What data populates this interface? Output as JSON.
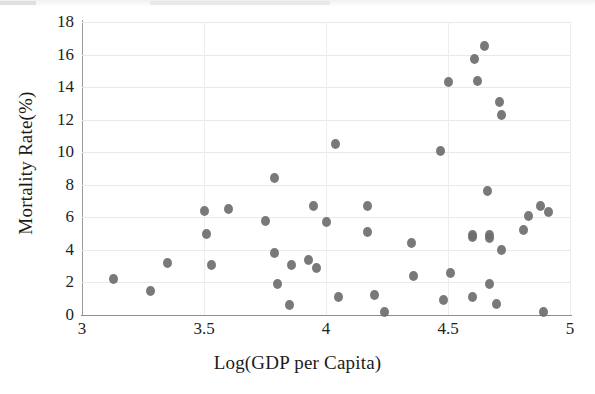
{
  "chart_data": {
    "type": "scatter",
    "title": "",
    "xlabel": "Log(GDP per Capita)",
    "ylabel": "Mortality Rate(%)",
    "xlim": [
      3,
      5
    ],
    "ylim": [
      0,
      18
    ],
    "xticks": [
      "3",
      "3.5",
      "4",
      "4.5",
      "5"
    ],
    "xtick_values": [
      3,
      3.5,
      4,
      4.5,
      5
    ],
    "yticks": [
      "0",
      "2",
      "4",
      "6",
      "8",
      "10",
      "12",
      "14",
      "16",
      "18"
    ],
    "ytick_values": [
      0,
      2,
      4,
      6,
      8,
      10,
      12,
      14,
      16,
      18
    ],
    "grid": "horizontal-and-vertical",
    "legend": "none",
    "marker_color": "#6e6e6e",
    "marker_shape": "circle",
    "series": [
      {
        "name": "countries",
        "points": [
          [
            3.13,
            2.2
          ],
          [
            3.28,
            1.5
          ],
          [
            3.35,
            3.2
          ],
          [
            3.5,
            6.4
          ],
          [
            3.51,
            5.0
          ],
          [
            3.53,
            3.1
          ],
          [
            3.6,
            6.5
          ],
          [
            3.75,
            5.8
          ],
          [
            3.79,
            8.4
          ],
          [
            3.79,
            3.8
          ],
          [
            3.8,
            1.9
          ],
          [
            3.85,
            0.6
          ],
          [
            3.86,
            3.1
          ],
          [
            3.93,
            3.4
          ],
          [
            3.95,
            6.7
          ],
          [
            3.96,
            2.9
          ],
          [
            4.0,
            5.7
          ],
          [
            4.04,
            10.5
          ],
          [
            4.05,
            1.1
          ],
          [
            4.17,
            6.7
          ],
          [
            4.17,
            5.1
          ],
          [
            4.2,
            1.2
          ],
          [
            4.24,
            0.2
          ],
          [
            4.35,
            4.4
          ],
          [
            4.36,
            2.4
          ],
          [
            4.47,
            10.1
          ],
          [
            4.48,
            0.9
          ],
          [
            4.5,
            14.3
          ],
          [
            4.51,
            2.6
          ],
          [
            4.6,
            4.9
          ],
          [
            4.6,
            4.8
          ],
          [
            4.6,
            1.1
          ],
          [
            4.61,
            15.7
          ],
          [
            4.62,
            14.4
          ],
          [
            4.65,
            16.5
          ],
          [
            4.66,
            7.6
          ],
          [
            4.67,
            4.9
          ],
          [
            4.67,
            4.7
          ],
          [
            4.67,
            1.9
          ],
          [
            4.7,
            0.7
          ],
          [
            4.71,
            13.1
          ],
          [
            4.72,
            12.3
          ],
          [
            4.72,
            4.0
          ],
          [
            4.81,
            5.2
          ],
          [
            4.83,
            6.1
          ],
          [
            4.88,
            6.7
          ],
          [
            4.89,
            0.2
          ],
          [
            4.91,
            6.3
          ]
        ]
      }
    ]
  }
}
